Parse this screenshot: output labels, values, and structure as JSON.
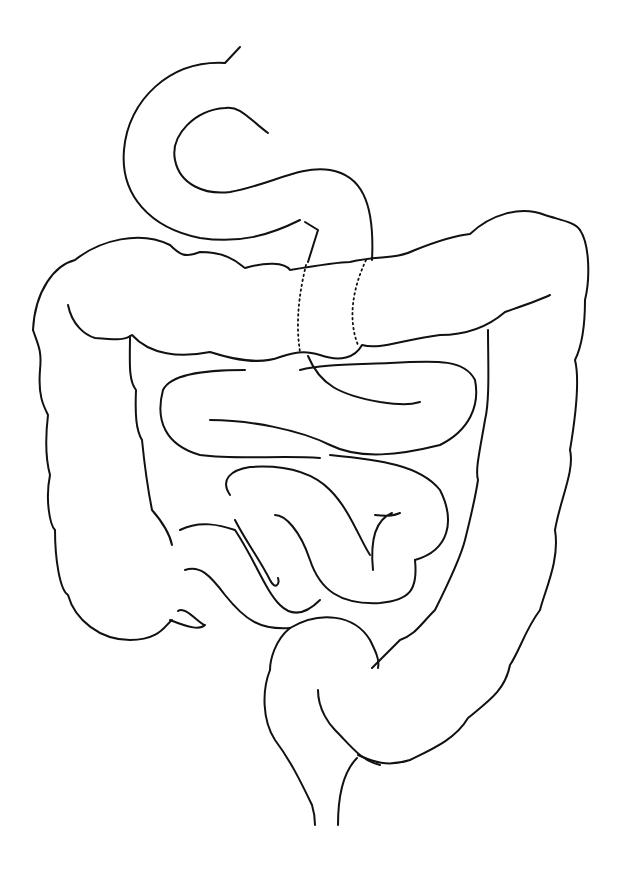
{
  "illustration": {
    "subject": "intestines line drawing",
    "background": "#ffffff",
    "stroke": "#111111",
    "parts": [
      "duodenum",
      "transverse-colon",
      "ascending-colon",
      "descending-colon",
      "small-intestine",
      "appendix",
      "sigmoid-colon",
      "rectum"
    ]
  }
}
